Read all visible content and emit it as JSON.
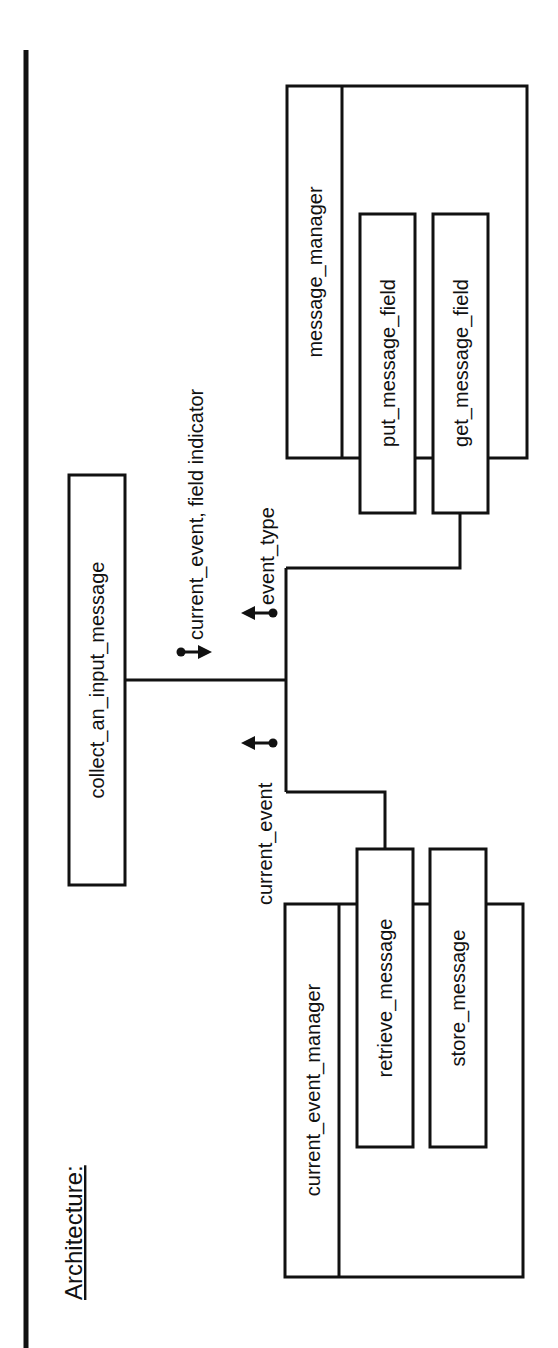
{
  "title": "Architecture:",
  "orientation": "rotated 90° counter-clockwise",
  "modules": {
    "collect": {
      "label": "collect_an_input_message"
    },
    "message_manager": {
      "label": "message_manager",
      "operations": [
        {
          "label": "put_message_field"
        },
        {
          "label": "get_message_field"
        }
      ]
    },
    "current_event_manager": {
      "label": "current_event_manager",
      "operations": [
        {
          "label": "retrieve_message"
        },
        {
          "label": "store_message"
        }
      ]
    }
  },
  "couples": [
    {
      "label": "current_event, field indicator",
      "direction": "to collect_an_input_message's callee (down)"
    },
    {
      "label": "event_type",
      "direction": "up from get_message_field"
    },
    {
      "label": "current_event",
      "direction": "up from retrieve_message"
    }
  ],
  "colors": {
    "ink": "#111111",
    "background": "#ffffff"
  }
}
